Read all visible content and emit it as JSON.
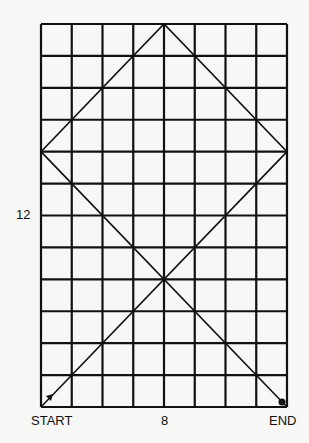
{
  "diagram": {
    "grid": {
      "columns": 8,
      "rows": 12,
      "line_color": "#111111",
      "background": "#f7f7f5"
    },
    "labels": {
      "start": "START",
      "end": "END",
      "width": "8",
      "height": "12"
    },
    "path": {
      "description": "Path from START (bottom-left) bouncing across grid to END (bottom-right)",
      "points_grid_from_top": [
        [
          0,
          12
        ],
        [
          8,
          4
        ],
        [
          4,
          0
        ],
        [
          0,
          4
        ],
        [
          8,
          12
        ]
      ]
    },
    "markers": {
      "start": "arrow",
      "end": "dot"
    }
  }
}
